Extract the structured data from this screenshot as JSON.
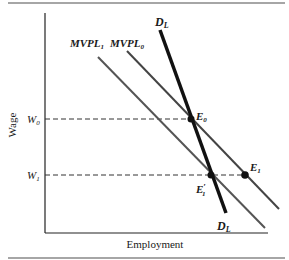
{
  "figure": {
    "x_axis_label": "Employment",
    "y_axis_label": "Wage",
    "colors": {
      "axis": "#222222",
      "demand_curve": "#111111",
      "mvpl_curves": "#555555",
      "dashed_guides": "#333333",
      "rule": "#888888"
    },
    "y_ticks": [
      {
        "id": "W0",
        "main": "W",
        "sub": "0"
      },
      {
        "id": "W1",
        "main": "W",
        "sub": "1"
      }
    ],
    "curves": {
      "mvpl1": {
        "main": "MVPL",
        "sub": "1"
      },
      "mvpl0": {
        "main": "MVPL",
        "sub": "0"
      },
      "demand_top": {
        "main": "D",
        "sub": "L"
      },
      "demand_bottom": {
        "main": "D",
        "sub": "L"
      }
    },
    "points": {
      "E0": {
        "main": "E",
        "sub": "0"
      },
      "E1": {
        "main": "E",
        "sub": "1"
      },
      "E1prime": {
        "main": "E",
        "sub": "1",
        "prime": "′"
      }
    }
  }
}
